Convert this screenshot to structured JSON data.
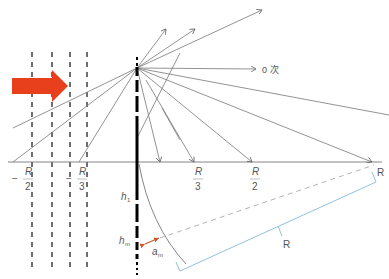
{
  "diagram": {
    "labels": {
      "zero_order": "0 次",
      "neg_r_over_2_minus": "−",
      "neg_r_over_2_num": "R",
      "neg_r_over_2_den": "2",
      "neg_r_over_3_minus": "−",
      "neg_r_over_3_num": "R",
      "neg_r_over_3_den": "3",
      "r_over_3_num": "R",
      "r_over_3_den": "3",
      "r_over_2_num": "R",
      "r_over_2_den": "2",
      "r_axis": "R",
      "r_bracket": "R",
      "h1": "h",
      "h1_sub": "1",
      "hm": "h",
      "hm_sub": "m",
      "am": "a",
      "am_sub": "m"
    },
    "colors": {
      "arrow": "#e8401c",
      "lines": "#777777",
      "grating": "#000000",
      "bracket": "#8fc3e0",
      "dashed_radius": "#aaaaaa",
      "am_arrow": "#d2552a"
    }
  }
}
